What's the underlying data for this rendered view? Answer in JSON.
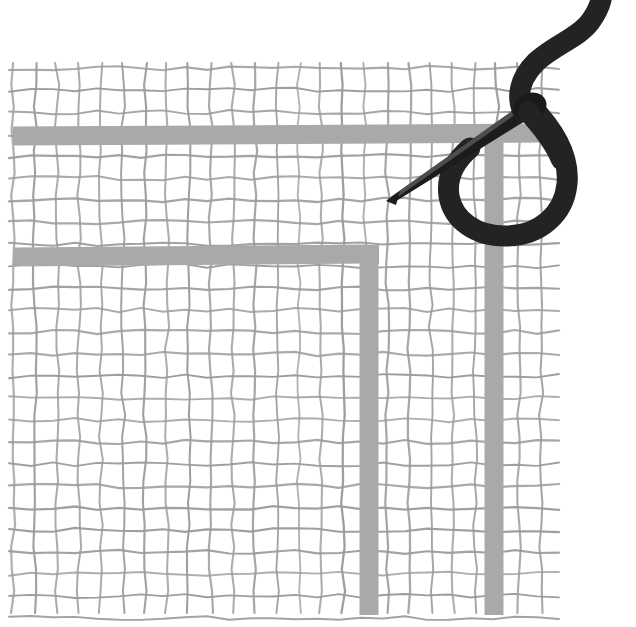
{
  "scene": {
    "title": "Needle and thread stitching on canvas grid fabric",
    "type": "instructional-illustration",
    "canvas": {
      "width": 636,
      "height": 627,
      "background_color": "#ffffff"
    }
  },
  "fabric": {
    "name": "canvas-grid-fabric",
    "grid_line_color": "#9b9b9b",
    "grid_line_width": 2,
    "cell_size": 22,
    "columns": 25,
    "rows": 25,
    "bounds": {
      "x": 13,
      "y": 68,
      "width": 544,
      "height": 559
    },
    "jitter_amount": 2.2
  },
  "stitches": {
    "thread_color": "#a9a9a9",
    "band_width": 19,
    "items": [
      {
        "name": "upper-horizontal-stitch",
        "orientation": "horizontal",
        "x1": 13,
        "y1": 136,
        "x2": 557,
        "y2": 133
      },
      {
        "name": "lower-horizontal-stitch",
        "orientation": "horizontal",
        "x1": 13,
        "y1": 257,
        "x2": 369,
        "y2": 254
      },
      {
        "name": "left-vertical-stitch",
        "orientation": "vertical",
        "x1": 369,
        "y1": 254,
        "x2": 369,
        "y2": 615
      },
      {
        "name": "right-vertical-stitch",
        "orientation": "vertical",
        "x1": 494,
        "y1": 133,
        "x2": 494,
        "y2": 615
      }
    ]
  },
  "needle": {
    "name": "sewing-needle",
    "color": "#1e1e1e",
    "tip": {
      "x": 388,
      "y": 198
    },
    "eye": {
      "x": 541,
      "y": 103
    },
    "angle_degrees": -33
  },
  "thread": {
    "name": "black-thread",
    "color": "#232323",
    "stroke_width": 19,
    "loop_bottom": {
      "x": 535,
      "y": 234
    },
    "tail_top": {
      "x": 600,
      "y": 8
    },
    "path_description": "loop from needle eye down around and back up, with wavy tail exiting top-right"
  },
  "labels": {
    "figure_caption": "",
    "step_number": ""
  }
}
